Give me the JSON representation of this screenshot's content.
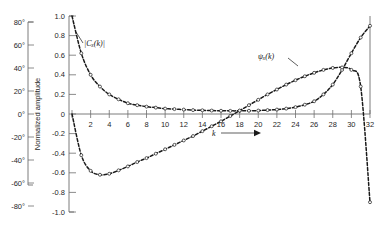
{
  "chart_data": {
    "type": "line",
    "title": "",
    "subtitle": "",
    "xlabel": "k",
    "xlabel_arrow": "⟶",
    "ylabel": "Normalized amplitude",
    "ylabel_secondary_unit": "degrees",
    "xlim": [
      0,
      32
    ],
    "ylim": [
      -1.0,
      1.0
    ],
    "grid": false,
    "legend_position": "inline-annotations",
    "x_ticks": [
      0,
      2,
      4,
      6,
      8,
      10,
      12,
      14,
      16,
      18,
      20,
      22,
      24,
      26,
      28,
      30,
      32
    ],
    "x_tick_labels": [
      "",
      "2",
      "4",
      "6",
      "8",
      "10",
      "12",
      "14",
      "16",
      "18",
      "20",
      "22",
      "24",
      "26",
      "28",
      "30",
      "32"
    ],
    "y_ticks": [
      -1.0,
      -0.8,
      -0.6,
      -0.4,
      -0.2,
      0,
      0.2,
      0.4,
      0.6,
      0.8,
      1.0
    ],
    "y_tick_labels": [
      "-1.0",
      "-0.8",
      "-0.6",
      "-0.4",
      "-0.2",
      "0",
      "0.2",
      "0.4",
      "0.6",
      "0.8",
      "1.0"
    ],
    "y_ticks_degrees": [
      -80,
      -60,
      -40,
      -20,
      0,
      20,
      40,
      60,
      80
    ],
    "y_tick_labels_degrees": [
      "-80°",
      "-60°",
      "-40°",
      "-20°",
      "0°",
      "20°",
      "40°",
      "60°",
      "80°"
    ],
    "series": [
      {
        "name": "|C_x(k)|",
        "label": "|Cₓ(k)|",
        "label_x": 6.5,
        "label_y": 0.63,
        "axis": "normalized amplitude",
        "style": "dashed with open circle markers",
        "x": [
          0,
          1,
          2,
          3,
          4,
          5,
          6,
          7,
          8,
          9,
          10,
          11,
          12,
          13,
          14,
          15,
          16,
          17,
          18,
          19,
          20,
          21,
          22,
          23,
          24,
          25,
          26,
          27,
          28,
          29,
          30,
          31,
          32
        ],
        "values": [
          1.0,
          0.62,
          0.4,
          0.28,
          0.2,
          0.15,
          0.11,
          0.09,
          0.075,
          0.065,
          0.055,
          0.05,
          0.045,
          0.04,
          0.038,
          0.035,
          0.033,
          0.032,
          0.032,
          0.033,
          0.035,
          0.04,
          0.045,
          0.055,
          0.07,
          0.095,
          0.13,
          0.2,
          0.3,
          0.45,
          0.62,
          0.78,
          0.9
        ]
      },
      {
        "name": "psi_x(k)",
        "label": "ψₓ(k)",
        "label_x": 21.5,
        "label_y": 0.42,
        "axis": "degrees",
        "style": "dashed with open circle markers",
        "x": [
          0,
          1,
          2,
          3,
          4,
          5,
          6,
          7,
          8,
          9,
          10,
          11,
          12,
          13,
          14,
          15,
          16,
          17,
          18,
          19,
          20,
          21,
          22,
          23,
          24,
          25,
          26,
          27,
          28,
          29,
          30,
          31,
          32
        ],
        "values": [
          0.0,
          -0.42,
          -0.58,
          -0.62,
          -0.61,
          -0.575,
          -0.535,
          -0.49,
          -0.45,
          -0.405,
          -0.36,
          -0.315,
          -0.27,
          -0.225,
          -0.175,
          -0.125,
          -0.075,
          -0.02,
          0.035,
          0.09,
          0.145,
          0.2,
          0.25,
          0.3,
          0.345,
          0.385,
          0.42,
          0.45,
          0.47,
          0.475,
          0.45,
          0.28,
          -0.9
        ]
      }
    ],
    "annotations": [
      {
        "text": "|Cₓ(k)|",
        "kind": "series-label"
      },
      {
        "text": "ψₓ(k)",
        "kind": "series-label"
      }
    ]
  },
  "axes": {
    "x_axis_name": "k-axis",
    "y_axis_name": "normalized-amplitude-axis",
    "y_axis_secondary_name": "degrees-axis"
  }
}
